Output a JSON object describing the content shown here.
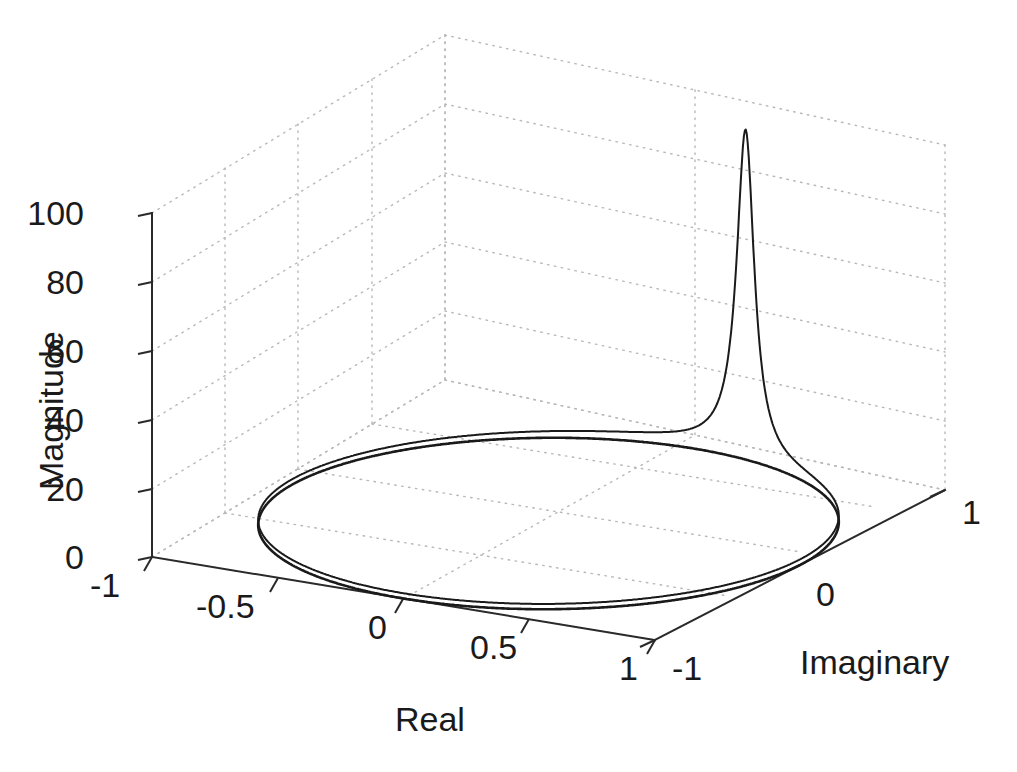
{
  "chart_data": {
    "type": "line",
    "title": "",
    "subtitle": "",
    "projection": "3d",
    "xlabel": "Real",
    "ylabel": "Imaginary",
    "zlabel": "Magnitude",
    "xlim": [
      -1,
      1
    ],
    "ylim": [
      -1,
      1
    ],
    "zlim": [
      0,
      100
    ],
    "xticks": [
      "-1",
      "-0.5",
      "0",
      "0.5",
      "1"
    ],
    "xtick_values": [
      -1,
      -0.5,
      0,
      0.5,
      1
    ],
    "yticks": [
      "-1",
      "0",
      "1"
    ],
    "ytick_values": [
      -1,
      0,
      1
    ],
    "zticks": [
      "0",
      "20",
      "40",
      "60",
      "80",
      "100"
    ],
    "ztick_values": [
      0,
      20,
      40,
      60,
      80,
      100
    ],
    "grid": true,
    "grid_style": "dotted",
    "legend": "none",
    "line_color": "#1a1a1a",
    "grid_color": "#b8b8b8",
    "axis_color": "#3a3a3a",
    "background": "#ffffff",
    "series": [
      {
        "name": "unit-circle-base",
        "description": "Unit circle traced on the z = 0 base plane",
        "z_constant": 0,
        "radius": 1.0,
        "closed": true
      },
      {
        "name": "magnitude-on-unit-circle",
        "description": "Magnitude of the transfer function evaluated on the unit circle, rising to a sharp resonance peak near Real = 0.22, Imaginary = 0.97",
        "peak_magnitude": 96,
        "peak_real": 0.22,
        "peak_imaginary": 0.97,
        "baseline_magnitude": 1.5,
        "resonance_width": 0.05,
        "samples": [
          {
            "theta_deg": 0,
            "magnitude": 1.6
          },
          {
            "theta_deg": 15,
            "magnitude": 1.7
          },
          {
            "theta_deg": 30,
            "magnitude": 1.9
          },
          {
            "theta_deg": 45,
            "magnitude": 2.2
          },
          {
            "theta_deg": 60,
            "magnitude": 3.0
          },
          {
            "theta_deg": 70,
            "magnitude": 4.5
          },
          {
            "theta_deg": 76,
            "magnitude": 8.0
          },
          {
            "theta_deg": 80,
            "magnitude": 18.0
          },
          {
            "theta_deg": 82,
            "magnitude": 35.0
          },
          {
            "theta_deg": 83.5,
            "magnitude": 65.0
          },
          {
            "theta_deg": 84.5,
            "magnitude": 96.0
          },
          {
            "theta_deg": 85.5,
            "magnitude": 70.0
          },
          {
            "theta_deg": 87,
            "magnitude": 36.0
          },
          {
            "theta_deg": 89,
            "magnitude": 17.0
          },
          {
            "theta_deg": 93,
            "magnitude": 7.0
          },
          {
            "theta_deg": 100,
            "magnitude": 4.0
          },
          {
            "theta_deg": 115,
            "magnitude": 2.6
          },
          {
            "theta_deg": 135,
            "magnitude": 2.0
          },
          {
            "theta_deg": 160,
            "magnitude": 1.7
          },
          {
            "theta_deg": 180,
            "magnitude": 1.6
          },
          {
            "theta_deg": 220,
            "magnitude": 1.5
          },
          {
            "theta_deg": 260,
            "magnitude": 1.5
          },
          {
            "theta_deg": 300,
            "magnitude": 1.5
          },
          {
            "theta_deg": 340,
            "magnitude": 1.5
          },
          {
            "theta_deg": 360,
            "magnitude": 1.6
          }
        ]
      }
    ]
  },
  "axes": {
    "x": {
      "title": "Real",
      "ticks": [
        "-1",
        "-0.5",
        "0",
        "0.5",
        "1"
      ]
    },
    "y": {
      "title": "Imaginary",
      "ticks": [
        "-1",
        "0",
        "1"
      ]
    },
    "z": {
      "title": "Magnitude",
      "ticks": [
        "0",
        "20",
        "40",
        "60",
        "80",
        "100"
      ]
    }
  }
}
